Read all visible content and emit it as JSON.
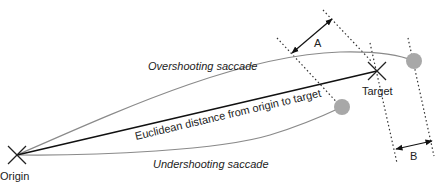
{
  "diagram": {
    "labels": {
      "origin": "Origin",
      "target": "Target",
      "overshoot": "Overshooting saccade",
      "undershoot": "Undershooting saccade",
      "euclidean": "Euclidean distance from origin to target",
      "a": "A",
      "b": "B"
    },
    "colors": {
      "line": "#111111",
      "saccade": "#8a8a8a",
      "endpoint": "#a8a8a8",
      "dotted": "#333333"
    }
  }
}
